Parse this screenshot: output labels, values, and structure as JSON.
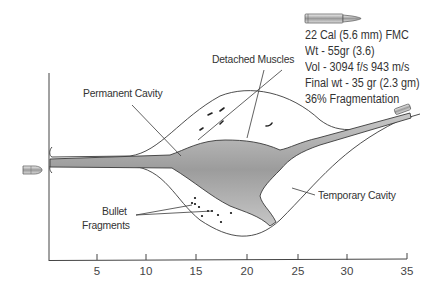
{
  "specs": {
    "caliber": "22 Cal (5.6 mm) FMC",
    "weight": "Wt - 55gr (3.6)",
    "velocity": "Vol - 3094 f/s 943 m/s",
    "final_weight": "Final wt - 35 gr (2.3 gm)",
    "fragmentation": "36% Fragmentation"
  },
  "labels": {
    "detached_muscles": "Detached Muscles",
    "permanent_cavity": "Permanent Cavity",
    "temporary_cavity": "Temporary Cavity",
    "bullet_fragments_line1": "Bullet",
    "bullet_fragments_line2": "Fragments"
  },
  "axis": {
    "ticks": [
      "5",
      "10",
      "15",
      "20",
      "25",
      "30",
      "35"
    ]
  },
  "colors": {
    "outline": "#3a3a3a",
    "cavity_fill": "#a8a8a8",
    "text": "#333333"
  }
}
